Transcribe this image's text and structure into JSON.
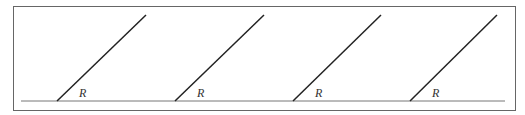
{
  "diagram": {
    "frame": {
      "x": 13,
      "y": 6,
      "width": 502,
      "height": 104,
      "stroke": "#666666"
    },
    "baseline": {
      "x1": 21,
      "y1": 101,
      "x2": 505,
      "y2": 101,
      "stroke": "#777777"
    },
    "rays": [
      {
        "x1": 57,
        "y1": 101,
        "x2": 146,
        "y2": 15,
        "label": "R",
        "label_x": 79,
        "label_y": 97
      },
      {
        "x1": 175,
        "y1": 101,
        "x2": 264,
        "y2": 15,
        "label": "R",
        "label_x": 197,
        "label_y": 97
      },
      {
        "x1": 293,
        "y1": 101,
        "x2": 381,
        "y2": 15,
        "label": "R",
        "label_x": 315,
        "label_y": 97
      },
      {
        "x1": 410,
        "y1": 101,
        "x2": 497,
        "y2": 15,
        "label": "R",
        "label_x": 432,
        "label_y": 97
      }
    ],
    "ray_color": "#222222"
  }
}
